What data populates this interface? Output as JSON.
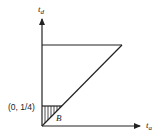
{
  "diagram": {
    "y_axis_label": "t",
    "y_axis_subscript": "d",
    "x_axis_label": "t",
    "x_axis_subscript": "a",
    "point_label": "(0, 1/4)",
    "region_label": "B",
    "colors": {
      "stroke": "#222222",
      "background": "#ffffff"
    }
  }
}
